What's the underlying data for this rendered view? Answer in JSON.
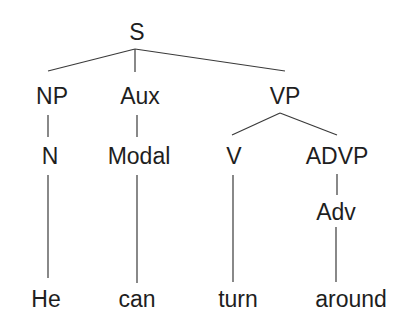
{
  "diagram": {
    "type": "syntax-tree",
    "sentence": "He can turn around",
    "nodes": {
      "s": {
        "label": "S"
      },
      "np": {
        "label": "NP"
      },
      "aux": {
        "label": "Aux"
      },
      "vp": {
        "label": "VP"
      },
      "n": {
        "label": "N"
      },
      "modal": {
        "label": "Modal"
      },
      "v": {
        "label": "V"
      },
      "advp": {
        "label": "ADVP"
      },
      "adv": {
        "label": "Adv"
      },
      "he": {
        "label": "He"
      },
      "can": {
        "label": "can"
      },
      "turn": {
        "label": "turn"
      },
      "around": {
        "label": "around"
      }
    },
    "edges": [
      [
        "S",
        "NP"
      ],
      [
        "S",
        "Aux"
      ],
      [
        "S",
        "VP"
      ],
      [
        "NP",
        "N"
      ],
      [
        "Aux",
        "Modal"
      ],
      [
        "VP",
        "V"
      ],
      [
        "VP",
        "ADVP"
      ],
      [
        "N",
        "He"
      ],
      [
        "Modal",
        "can"
      ],
      [
        "V",
        "turn"
      ],
      [
        "ADVP",
        "Adv"
      ],
      [
        "Adv",
        "around"
      ]
    ],
    "colors": {
      "text": "#1e1e1e",
      "lines": "#3a3a3a",
      "background": "#ffffff"
    }
  }
}
